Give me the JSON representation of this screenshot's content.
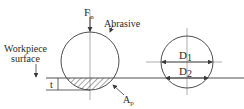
{
  "diagram": {
    "labels": {
      "force": "F",
      "force_sub": "n",
      "abrasive": "Abrasive",
      "workpiece_line1": "Workpiece",
      "workpiece_line2": "surface",
      "depth": "t",
      "area": "A",
      "area_sub": "p",
      "d1": "D",
      "d1_sub": "1",
      "d2": "D",
      "d2_sub": "2"
    },
    "colors": {
      "stroke": "#3a3a3a",
      "centerline": "#8a8a8a",
      "hatch": "#3a3a3a",
      "background": "#ffffff"
    }
  }
}
